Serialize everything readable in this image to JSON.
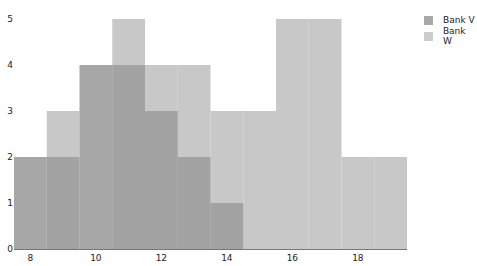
{
  "chart_data": {
    "type": "bar",
    "subtype": "overlapping-histogram",
    "title": "",
    "xlabel": "",
    "ylabel": "",
    "bin_width": 1,
    "bin_edges": [
      7.5,
      8.5,
      9.5,
      10.5,
      11.5,
      12.5,
      13.5,
      14.5,
      15.5,
      16.5,
      17.5,
      18.5,
      19.5
    ],
    "categories": [
      "8",
      "9",
      "10",
      "11",
      "12",
      "13",
      "14",
      "15",
      "16",
      "17",
      "18",
      "19"
    ],
    "series": [
      {
        "name": "Bank V",
        "color": "#a0a0a0",
        "values": [
          2,
          2,
          4,
          4,
          3,
          2,
          1,
          0,
          0,
          0,
          0,
          0
        ]
      },
      {
        "name": "Bank W",
        "color": "#c8c8c8",
        "values": [
          0,
          3,
          0,
          5,
          4,
          4,
          3,
          3,
          5,
          5,
          2,
          2
        ]
      }
    ],
    "xlim": [
      7.5,
      19.5
    ],
    "ylim": [
      0,
      5
    ],
    "xticks": [
      8,
      10,
      12,
      14,
      16,
      18
    ],
    "yticks": [
      0,
      1,
      2,
      3,
      4,
      5
    ],
    "grid": false,
    "legend_position": "top-right"
  },
  "legend": {
    "items": [
      {
        "label": "Bank V",
        "color": "#a8a8a8"
      },
      {
        "label": "Bank W",
        "color": "#cbcbcb"
      }
    ]
  }
}
